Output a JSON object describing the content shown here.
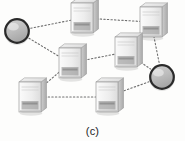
{
  "figure": {
    "caption": "(c)",
    "background_color": "#fdfdfc",
    "type": "network-topology-diagram"
  },
  "style": {
    "edge_color": "#6f6f6f",
    "edge_width": 1.1,
    "edge_dash": "1.4,2.2",
    "circle_fill": "#b9b9b9",
    "circle_ring": "#2a2a2a",
    "server_body_light": "#f2f2f2",
    "server_body_mid": "#d8d8d8",
    "server_body_dark": "#b0b0b0",
    "server_outline": "#9a9a9a",
    "server_panel": "#8a8a8a"
  },
  "nodes": [
    {
      "id": "gw-left",
      "name": "gateway-node-left",
      "kind": "circle",
      "x": 17,
      "y": 31,
      "r": 13
    },
    {
      "id": "gw-right",
      "name": "gateway-node-right",
      "kind": "circle",
      "x": 162,
      "y": 77,
      "r": 13
    },
    {
      "id": "srv-top",
      "name": "server-node-top",
      "kind": "server",
      "x": 82,
      "y": 18,
      "w": 22,
      "h": 30
    },
    {
      "id": "srv-topright",
      "name": "server-node-top-right",
      "kind": "server",
      "x": 151,
      "y": 22,
      "w": 22,
      "h": 30
    },
    {
      "id": "srv-middle",
      "name": "server-node-middle",
      "kind": "server",
      "x": 70,
      "y": 63,
      "w": 22,
      "h": 30
    },
    {
      "id": "srv-midright",
      "name": "server-node-middle-right",
      "kind": "server",
      "x": 126,
      "y": 52,
      "w": 22,
      "h": 30
    },
    {
      "id": "srv-bottomleft",
      "name": "server-node-bottom-left",
      "kind": "server",
      "x": 30,
      "y": 97,
      "w": 22,
      "h": 30
    },
    {
      "id": "srv-bottommid",
      "name": "server-node-bottom-middle",
      "kind": "server",
      "x": 107,
      "y": 97,
      "w": 22,
      "h": 30
    }
  ],
  "edges": [
    {
      "name": "link-gwleft-srvtop",
      "from": "gw-left",
      "to": "srv-top"
    },
    {
      "name": "link-srvtop-srvtopright",
      "from": "srv-top",
      "to": "srv-topright"
    },
    {
      "name": "link-gwleft-srvmiddle",
      "from": "gw-left",
      "to": "srv-middle"
    },
    {
      "name": "link-srvmiddle-srvmidright",
      "from": "srv-middle",
      "to": "srv-midright"
    },
    {
      "name": "link-srvtopright-gwright",
      "from": "srv-topright",
      "to": "gw-right"
    },
    {
      "name": "link-srvmidright-gwright",
      "from": "srv-midright",
      "to": "gw-right"
    },
    {
      "name": "link-srvmiddle-srvbottomleft",
      "from": "srv-middle",
      "to": "srv-bottomleft"
    },
    {
      "name": "link-srvbottomleft-srvbottommid",
      "from": "srv-bottomleft",
      "to": "srv-bottommid"
    },
    {
      "name": "link-srvbottommid-gwright",
      "from": "srv-bottommid",
      "to": "gw-right"
    }
  ]
}
